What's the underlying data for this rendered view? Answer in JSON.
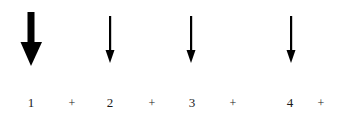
{
  "figure": {
    "background_color": "#ffffff",
    "ink_color": "#000000",
    "text_color": "#1a1a1a",
    "width": 349,
    "height": 122
  },
  "arrows": [
    {
      "name": "arrow-1",
      "label": "down-arrow-bold",
      "index": 1,
      "x": 31,
      "y_top": 12,
      "y_bottom": 66,
      "shaft_width": 7,
      "head_width": 21,
      "head_height": 24,
      "weight": "bold",
      "direction": "down",
      "color": "#000000"
    },
    {
      "name": "arrow-2",
      "label": "down-arrow-thin",
      "index": 2,
      "x": 110,
      "y_top": 16,
      "y_bottom": 63,
      "shaft_width": 2,
      "head_width": 9,
      "head_height": 13,
      "weight": "thin",
      "direction": "down",
      "color": "#000000"
    },
    {
      "name": "arrow-3",
      "label": "down-arrow-thin",
      "index": 3,
      "x": 191,
      "y_top": 16,
      "y_bottom": 63,
      "shaft_width": 2,
      "head_width": 9,
      "head_height": 13,
      "weight": "thin",
      "direction": "down",
      "color": "#000000"
    },
    {
      "name": "arrow-4",
      "label": "down-arrow-thin",
      "index": 4,
      "x": 291,
      "y_top": 16,
      "y_bottom": 63,
      "shaft_width": 2,
      "head_width": 9,
      "head_height": 13,
      "weight": "thin",
      "direction": "down",
      "color": "#000000"
    }
  ],
  "sequence": {
    "expression": "1 + 2 + 3 + 4 +",
    "tokens": [
      {
        "text": "1",
        "kind": "number",
        "x": 31
      },
      {
        "text": "+",
        "kind": "operator",
        "x": 72
      },
      {
        "text": "2",
        "kind": "number",
        "x": 110
      },
      {
        "text": "+",
        "kind": "operator",
        "x": 152
      },
      {
        "text": "3",
        "kind": "number",
        "x": 192
      },
      {
        "text": "+",
        "kind": "operator",
        "x": 233
      },
      {
        "text": "4",
        "kind": "number",
        "x": 290
      },
      {
        "text": "+",
        "kind": "operator",
        "x": 321
      }
    ]
  }
}
